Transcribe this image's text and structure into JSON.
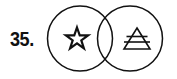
{
  "page": {
    "background_color": "#ffffff",
    "ink_color": "#111111",
    "width": 177,
    "height": 79
  },
  "item": {
    "number_label": "35.",
    "number_value": 35
  },
  "figure": {
    "name": "venn-diagram",
    "type": "two-overlapping-circles",
    "stroke_color": "#111111",
    "stroke_width": 1.5,
    "fill": "none",
    "overlap_region_content": "empty",
    "circles": [
      {
        "id": "left-circle",
        "cx": 36,
        "cy": 38.5,
        "r": 32.5,
        "contains": "star-symbol"
      },
      {
        "id": "right-circle",
        "cx": 86,
        "cy": 38.5,
        "r": 32.5,
        "contains": "stacked-triangle-symbol"
      }
    ],
    "symbols": [
      {
        "id": "star-symbol",
        "name": "five-pointed-star",
        "points": 5,
        "style": "outline",
        "cx": 33,
        "cy": 39,
        "size": 22,
        "stroke_width": 2.2
      },
      {
        "id": "stacked-triangle-symbol",
        "name": "triangle-with-two-horizontal-bars",
        "description": "triangle crossed by two horizontal lines forming a small apex triangle above a wide trapezoid",
        "cx": 93,
        "cy": 39,
        "width": 26,
        "height": 22,
        "bar_count": 2,
        "stroke_width": 1.6
      }
    ]
  }
}
